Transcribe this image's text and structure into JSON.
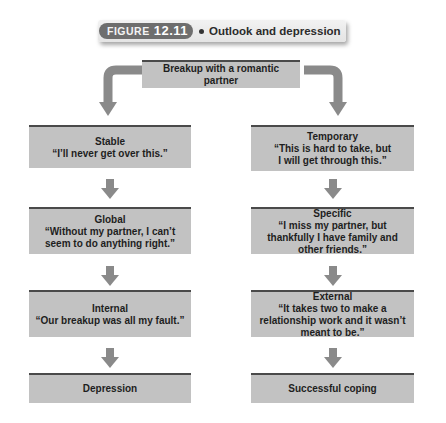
{
  "figure": {
    "label": "FIGURE",
    "number": "12.11",
    "title": "Outlook and depression"
  },
  "root": {
    "label": "Breakup with a romantic partner"
  },
  "left_column": {
    "boxes": [
      {
        "head": "Stable",
        "quote": "“I’ll never get over this.”"
      },
      {
        "head": "Global",
        "quote": "“Without my partner, I can’t seem to do anything right.”"
      },
      {
        "head": "Internal",
        "quote": "“Our breakup was all my fault.”"
      }
    ],
    "outcome": "Depression"
  },
  "right_column": {
    "boxes": [
      {
        "head": "Temporary",
        "quote": "“This is hard to take, but I will get through this.”"
      },
      {
        "head": "Specific",
        "quote": "“I miss my partner, but thankfully I have family and other friends.”"
      },
      {
        "head": "External",
        "quote": "“It takes two to make a relationship work and it wasn’t meant to be.”"
      }
    ],
    "outcome": "Successful coping"
  },
  "colors": {
    "box_fill": "#c2c2c2",
    "box_top_rule": "#4a4a4a",
    "arrow": "#8a8a8a",
    "figure_tag": "#6e6e6e"
  }
}
